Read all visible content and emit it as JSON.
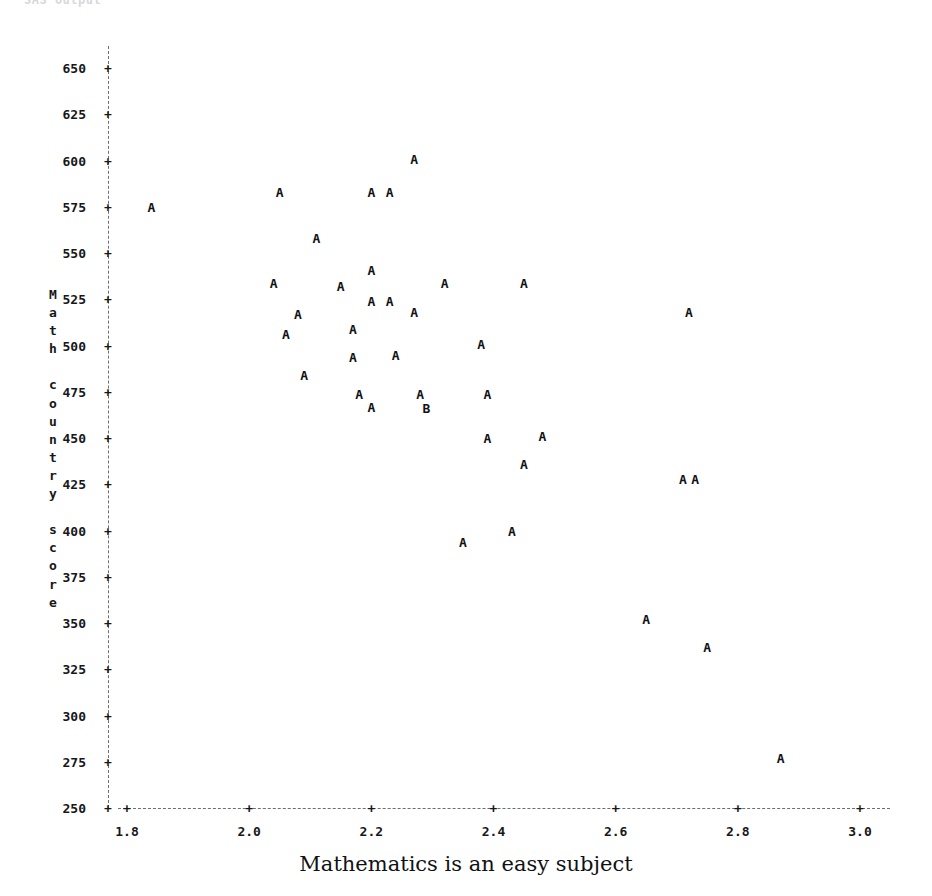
{
  "top_note": "SAS  Output",
  "axes": {
    "y_title_chars": [
      "M",
      "a",
      "t",
      "h",
      " ",
      "c",
      "o",
      "u",
      "n",
      "t",
      "r",
      "y",
      " ",
      "s",
      "c",
      "o",
      "r",
      "e"
    ],
    "y_ticks": [
      "650",
      "625",
      "600",
      "575",
      "550",
      "525",
      "500",
      "475",
      "450",
      "425",
      "400",
      "375",
      "350",
      "325",
      "300",
      "275",
      "250"
    ],
    "x_ticks": [
      "1.8",
      "2.0",
      "2.2",
      "2.4",
      "2.6",
      "2.8",
      "3.0"
    ],
    "tick_glyph": "+",
    "x_title": "Mathematics is an easy subject"
  },
  "chart_data": {
    "type": "scatter",
    "title": "",
    "xlabel": "Mathematics is an easy subject",
    "ylabel": "Math country score",
    "xlim": [
      1.75,
      3.05
    ],
    "ylim": [
      250,
      650
    ],
    "xticks": [
      1.8,
      2.0,
      2.2,
      2.4,
      2.6,
      2.8,
      3.0
    ],
    "yticks": [
      250,
      275,
      300,
      325,
      350,
      375,
      400,
      425,
      450,
      475,
      500,
      525,
      550,
      575,
      600,
      625,
      650
    ],
    "grid": false,
    "legend": "none",
    "marker_glyphs": {
      "A": "1 observation",
      "B": "2 observations"
    },
    "points": [
      {
        "x": 1.84,
        "y": 575,
        "label": "A"
      },
      {
        "x": 2.04,
        "y": 534,
        "label": "A"
      },
      {
        "x": 2.05,
        "y": 583,
        "label": "A"
      },
      {
        "x": 2.06,
        "y": 506,
        "label": "A"
      },
      {
        "x": 2.08,
        "y": 517,
        "label": "A"
      },
      {
        "x": 2.09,
        "y": 484,
        "label": "A"
      },
      {
        "x": 2.11,
        "y": 558,
        "label": "A"
      },
      {
        "x": 2.15,
        "y": 532,
        "label": "A"
      },
      {
        "x": 2.17,
        "y": 509,
        "label": "A"
      },
      {
        "x": 2.17,
        "y": 494,
        "label": "A"
      },
      {
        "x": 2.18,
        "y": 474,
        "label": "A"
      },
      {
        "x": 2.2,
        "y": 583,
        "label": "A"
      },
      {
        "x": 2.2,
        "y": 541,
        "label": "A"
      },
      {
        "x": 2.2,
        "y": 524,
        "label": "A"
      },
      {
        "x": 2.2,
        "y": 467,
        "label": "A"
      },
      {
        "x": 2.23,
        "y": 583,
        "label": "A"
      },
      {
        "x": 2.23,
        "y": 524,
        "label": "A"
      },
      {
        "x": 2.24,
        "y": 495,
        "label": "A"
      },
      {
        "x": 2.27,
        "y": 601,
        "label": "A"
      },
      {
        "x": 2.27,
        "y": 518,
        "label": "A"
      },
      {
        "x": 2.28,
        "y": 474,
        "label": "A"
      },
      {
        "x": 2.29,
        "y": 466,
        "label": "B"
      },
      {
        "x": 2.32,
        "y": 534,
        "label": "A"
      },
      {
        "x": 2.35,
        "y": 394,
        "label": "A"
      },
      {
        "x": 2.38,
        "y": 501,
        "label": "A"
      },
      {
        "x": 2.39,
        "y": 474,
        "label": "A"
      },
      {
        "x": 2.39,
        "y": 450,
        "label": "A"
      },
      {
        "x": 2.43,
        "y": 400,
        "label": "A"
      },
      {
        "x": 2.45,
        "y": 534,
        "label": "A"
      },
      {
        "x": 2.45,
        "y": 436,
        "label": "A"
      },
      {
        "x": 2.48,
        "y": 451,
        "label": "A"
      },
      {
        "x": 2.65,
        "y": 352,
        "label": "A"
      },
      {
        "x": 2.71,
        "y": 428,
        "label": "A"
      },
      {
        "x": 2.72,
        "y": 518,
        "label": "A"
      },
      {
        "x": 2.73,
        "y": 428,
        "label": "A"
      },
      {
        "x": 2.75,
        "y": 337,
        "label": "A"
      },
      {
        "x": 2.87,
        "y": 277,
        "label": "A"
      }
    ]
  }
}
